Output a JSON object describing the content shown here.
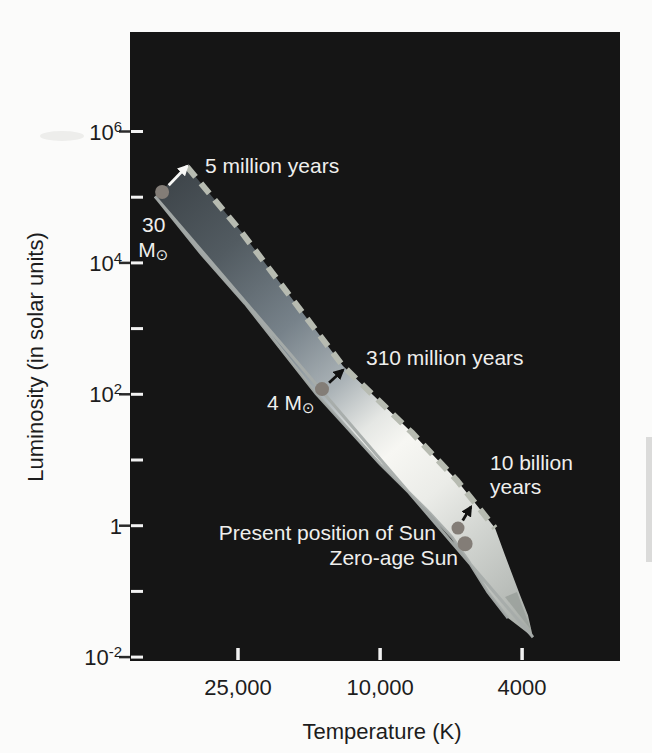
{
  "figure": {
    "caption": "",
    "type_note": "Hertzsprung-Russell diagram with main-sequence band and stellar lifetimes"
  },
  "colors": {
    "page_bg": "#fbfbfa",
    "plot_bg": "#151515",
    "dashed_line": "#b7bbb1",
    "edge_highlight": "#a6acaa",
    "dot": "#837d77",
    "arrow_white": "#f8f8f6",
    "arrow_black": "#111111",
    "text_light": "#efefed",
    "text_dark": "#1d1d1d",
    "artifact": "#dbdbda",
    "tick_inner": "#f2f2f2",
    "tick_outer": "#2a2a2a",
    "tail_shade": "#9aa09b"
  },
  "chart_data": {
    "type": "area",
    "title": "",
    "xlabel": "Temperature (K)",
    "ylabel": "Luminosity (in solar units)",
    "x_axis": {
      "scale": "log",
      "direction": "decreasing",
      "range": [
        52000,
        2600
      ],
      "ticks": [
        {
          "value": 25000,
          "label": "25,000"
        },
        {
          "value": 10000,
          "label": "10,000"
        },
        {
          "value": 4000,
          "label": "4000"
        }
      ]
    },
    "y_axis": {
      "scale": "log",
      "range": [
        0.0031,
        4600000
      ],
      "ticks": [
        {
          "value": 1000000,
          "base": "10",
          "sup": "6"
        },
        {
          "value": 100000
        },
        {
          "value": 10000,
          "base": "10",
          "sup": "4"
        },
        {
          "value": 1000
        },
        {
          "value": 100,
          "base": "10",
          "sup": "2"
        },
        {
          "value": 10
        },
        {
          "value": 1,
          "base": "1",
          "sup": ""
        },
        {
          "value": 0.1
        },
        {
          "value": 0.01,
          "base": "10",
          "sup": "-2"
        }
      ]
    },
    "band": {
      "name": "main sequence",
      "upper_edge_TL": [
        [
          34700,
          290000
        ],
        [
          24500,
          30000
        ],
        [
          12700,
          270
        ],
        [
          8140,
          26
        ],
        [
          6090,
          4.9
        ],
        [
          4765,
          0.92
        ],
        [
          4467,
          0.356
        ],
        [
          4055,
          0.0877
        ],
        [
          3852,
          0.0435
        ],
        [
          3730,
          0.0201
        ]
      ],
      "lower_edge_TL": [
        [
          4382,
          0.0392
        ],
        [
          4989,
          0.0975
        ],
        [
          5675,
          0.298
        ],
        [
          6288,
          0.668
        ],
        [
          7245,
          1.55
        ],
        [
          10000,
          8.7
        ],
        [
          15120,
          103
        ],
        [
          23900,
          2420
        ],
        [
          31950,
          14450
        ],
        [
          42700,
          103000
        ]
      ],
      "zams_dash_point_count": 6,
      "tail_shade_TL": [
        [
          3778,
          0.026
        ],
        [
          4467,
          0.082
        ],
        [
          4134,
          0.098
        ]
      ],
      "gradient_stops": [
        [
          0,
          "#3f464b"
        ],
        [
          0.15,
          "#525b61"
        ],
        [
          0.32,
          "#77828a"
        ],
        [
          0.45,
          "#aab2b6"
        ],
        [
          0.54,
          "#e5e7e4"
        ],
        [
          0.6,
          "#f7f7f3"
        ],
        [
          0.7,
          "#ebece8"
        ],
        [
          0.8,
          "#d2d5d1"
        ],
        [
          0.9,
          "#bcc0bc"
        ],
        [
          1,
          "#a4a9a4"
        ]
      ]
    },
    "stars": [
      {
        "name": "star-30-msun",
        "T": 40800,
        "L": 120000,
        "r": 7,
        "arrow_to": [
          34700,
          298000
        ],
        "arrow_color": "#f8f8f6"
      },
      {
        "name": "star-4-msun",
        "T": 14540,
        "L": 120,
        "r": 7,
        "arrow_to": [
          12700,
          234
        ],
        "arrow_color": "#111111"
      },
      {
        "name": "sun-present",
        "T": 6050,
        "L": 0.92,
        "r": 6.5,
        "arrow_to": [
          5565,
          1.93
        ],
        "arrow_color": "#111111"
      },
      {
        "name": "sun-zero-age",
        "T": 5780,
        "L": 0.53,
        "r": 7.5
      }
    ],
    "labels": [
      {
        "text": "5 million years",
        "T": 30930,
        "L": 309000,
        "align": "left"
      },
      {
        "text": "310 million years",
        "T": 10950,
        "L": 370,
        "align": "left"
      },
      {
        "text": "10 billion",
        "T": 4920,
        "L": 9.3,
        "align": "left"
      },
      {
        "text": "years",
        "T": 4920,
        "L": 3.9,
        "align": "left"
      },
      {
        "text": "Present position of Sun",
        "T": 6970,
        "L": 0.8,
        "align": "right"
      },
      {
        "text": "Zero-age Sun",
        "T": 6050,
        "L": 0.333,
        "align": "right"
      },
      {
        "text": "30",
        "T": 46450,
        "L": 39000,
        "align": "left"
      },
      {
        "text": "M",
        "sub": "⊙",
        "T": 47600,
        "L": 16300,
        "align": "left"
      },
      {
        "text": "4 M",
        "sub": "⊙",
        "T": 20730,
        "L": 76,
        "align": "left"
      }
    ]
  }
}
